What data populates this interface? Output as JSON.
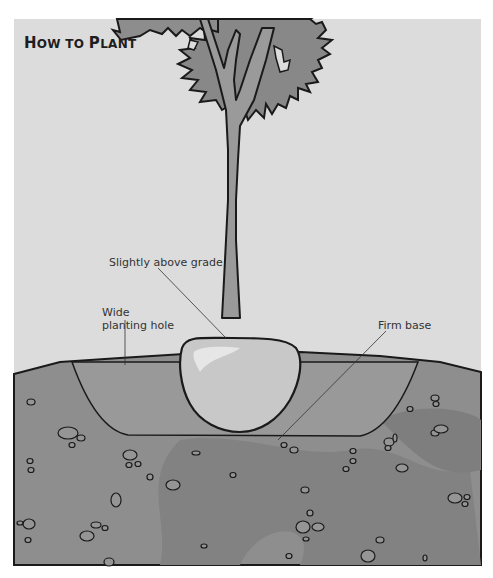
{
  "title": {
    "first": "H",
    "rest": "OW TO ",
    "first2": "P",
    "rest2": "LANT"
  },
  "labels": {
    "slightly_above_grade": "Slightly above grade",
    "wide_planting_hole_line1": "Wide",
    "wide_planting_hole_line2": "planting hole",
    "firm_base": "Firm base"
  },
  "colors": {
    "sky": "#dddddd",
    "soil": "#8e8e8e",
    "soil_dark": "#7f7f7f",
    "hole_fill": "#979797",
    "rootball": "#c9c9c9",
    "rootball_highlight": "#e2e2e2",
    "canopy": "#8a8a8a",
    "trunk": "#999999",
    "outline": "#1a1a1a"
  }
}
